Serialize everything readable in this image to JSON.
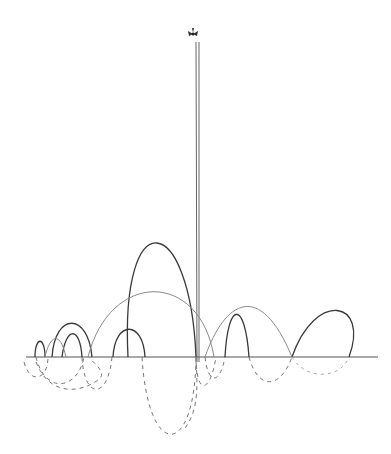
{
  "drawing": {
    "description": "Hand-drawn sketch of arcs above and dashed arcs below a horizontal baseline, with a tall vertical line topped by a small flower/butterfly glyph",
    "colors": {
      "ink_dark": "#3a3a3a",
      "ink_light": "#8a8a8a",
      "dash": "#777777",
      "background": "#ffffff"
    },
    "baseline_y": 357,
    "pole": {
      "x": 198,
      "top_y": 40,
      "bottom_y": 360
    },
    "glyph": {
      "name": "flower-icon",
      "x": 193,
      "y": 32
    }
  }
}
